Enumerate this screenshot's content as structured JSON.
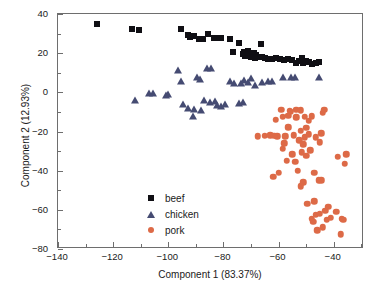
{
  "chart_data": {
    "type": "scatter",
    "title": "",
    "xlabel": "Component 1 (83.37%)",
    "ylabel": "Component 2 (12.93%)",
    "xlim": [
      -140,
      -29
    ],
    "ylim": [
      -80,
      40
    ],
    "xticks": [
      -140,
      -120,
      -100,
      -80,
      -60,
      -40
    ],
    "xticklabels": [
      "−140",
      "−120",
      "−100",
      "−80",
      "−60",
      "−40"
    ],
    "yticks": [
      40,
      20,
      0,
      -20,
      -40,
      -60,
      -80
    ],
    "yticklabels": [
      "40",
      "20",
      "0",
      "−20",
      "−40",
      "−60",
      "−80"
    ],
    "minor_xticks": [
      -130,
      -110,
      -90,
      -70,
      -50,
      -30
    ],
    "minor_yticks": [
      30,
      10,
      -10,
      -30,
      -50,
      -70
    ],
    "grid": false,
    "legend_position": "lower-left-inside",
    "series": [
      {
        "name": "beef",
        "marker": "square",
        "color": "#100f14",
        "points": [
          [
            -126.0,
            35.0
          ],
          [
            -113.0,
            32.3
          ],
          [
            -110.5,
            31.6
          ],
          [
            -95.5,
            32.2
          ],
          [
            -93.0,
            29.5
          ],
          [
            -92.0,
            28.5
          ],
          [
            -90.5,
            28.8
          ],
          [
            -89.0,
            27.2
          ],
          [
            -87.5,
            27.0
          ],
          [
            -85.5,
            30.0
          ],
          [
            -83.5,
            27.8
          ],
          [
            -82.5,
            27.6
          ],
          [
            -81.0,
            27.8
          ],
          [
            -77.5,
            27.3
          ],
          [
            -76.5,
            20.4
          ],
          [
            -74.5,
            25.0
          ],
          [
            -73.0,
            19.8
          ],
          [
            -72.5,
            20.5
          ],
          [
            -72.0,
            18.6
          ],
          [
            -71.0,
            21.0
          ],
          [
            -70.5,
            19.2
          ],
          [
            -70.0,
            17.8
          ],
          [
            -69.5,
            18.4
          ],
          [
            -69.0,
            20.2
          ],
          [
            -68.5,
            17.4
          ],
          [
            -68.0,
            19.0
          ],
          [
            -67.5,
            17.9
          ],
          [
            -66.5,
            24.7
          ],
          [
            -66.0,
            18.0
          ],
          [
            -65.0,
            17.5
          ],
          [
            -64.0,
            17.2
          ],
          [
            -62.5,
            17.1
          ],
          [
            -61.0,
            17.6
          ],
          [
            -59.5,
            16.9
          ],
          [
            -58.0,
            16.6
          ],
          [
            -56.5,
            16.8
          ],
          [
            -55.0,
            16.5
          ],
          [
            -53.5,
            15.2
          ],
          [
            -52.5,
            16.2
          ],
          [
            -51.5,
            17.4
          ],
          [
            -51.0,
            15.0
          ],
          [
            -50.0,
            16.0
          ],
          [
            -49.0,
            15.6
          ],
          [
            -48.0,
            14.6
          ],
          [
            -46.5,
            15.0
          ],
          [
            -45.5,
            15.4
          ]
        ]
      },
      {
        "name": "chicken",
        "marker": "triangle",
        "color": "#454b72",
        "points": [
          [
            -112.0,
            -3.8
          ],
          [
            -107.0,
            -0.2
          ],
          [
            -105.5,
            -0.4
          ],
          [
            -101.0,
            -1.2
          ],
          [
            -100.0,
            -1.0
          ],
          [
            -96.5,
            11.5
          ],
          [
            -95.5,
            5.8
          ],
          [
            -94.5,
            -6.0
          ],
          [
            -93.0,
            -8.0
          ],
          [
            -91.0,
            -12.0
          ],
          [
            -90.5,
            -8.5
          ],
          [
            -89.5,
            7.8
          ],
          [
            -88.5,
            7.0
          ],
          [
            -88.0,
            -9.0
          ],
          [
            -87.0,
            -4.0
          ],
          [
            -86.0,
            12.6
          ],
          [
            -85.0,
            -5.0
          ],
          [
            -84.5,
            12.4
          ],
          [
            -83.0,
            -4.5
          ],
          [
            -82.5,
            -6.6
          ],
          [
            -81.0,
            -7.0
          ],
          [
            -79.5,
            -6.2
          ],
          [
            -77.5,
            5.8
          ],
          [
            -76.0,
            4.6
          ],
          [
            -74.5,
            -5.2
          ],
          [
            -73.5,
            4.8
          ],
          [
            -73.0,
            -4.8
          ],
          [
            -72.5,
            6.2
          ],
          [
            -71.0,
            5.4
          ],
          [
            -70.0,
            7.3
          ],
          [
            -68.5,
            3.8
          ],
          [
            -66.0,
            5.4
          ],
          [
            -64.0,
            6.0
          ],
          [
            -62.5,
            5.6
          ],
          [
            -58.5,
            7.6
          ],
          [
            -55.5,
            8.0
          ],
          [
            -54.0,
            7.8
          ],
          [
            -45.5,
            7.7
          ]
        ]
      },
      {
        "name": "pork",
        "marker": "circle",
        "color": "#dd6a47",
        "points": [
          [
            -67.5,
            -22.3
          ],
          [
            -65.0,
            -22.2
          ],
          [
            -63.0,
            -22.0
          ],
          [
            -61.0,
            -14.0
          ],
          [
            -60.5,
            -22.4
          ],
          [
            -60.0,
            -41.0
          ],
          [
            -59.0,
            -8.8
          ],
          [
            -58.5,
            -28.8
          ],
          [
            -57.5,
            -22.5
          ],
          [
            -56.5,
            -17.8
          ],
          [
            -56.0,
            -9.5
          ],
          [
            -55.5,
            -10.0
          ],
          [
            -55.0,
            -31.5
          ],
          [
            -54.5,
            -22.0
          ],
          [
            -54.0,
            -35.5
          ],
          [
            -53.5,
            -9.0
          ],
          [
            -53.0,
            -40.0
          ],
          [
            -52.5,
            -24.5
          ],
          [
            -52.0,
            -19.5
          ],
          [
            -52.0,
            -9.2
          ],
          [
            -51.5,
            -30.5
          ],
          [
            -51.0,
            -45.8
          ],
          [
            -50.5,
            -23.0
          ],
          [
            -50.5,
            -12.5
          ],
          [
            -50.0,
            -32.5
          ],
          [
            -49.5,
            -57.0
          ],
          [
            -49.0,
            -21.5
          ],
          [
            -48.5,
            -29.5
          ],
          [
            -48.0,
            -64.5
          ],
          [
            -47.5,
            -66.0
          ],
          [
            -47.0,
            -55.5
          ],
          [
            -47.0,
            -41.0
          ],
          [
            -46.5,
            -23.0
          ],
          [
            -46.5,
            -62.5
          ],
          [
            -46.0,
            -70.5
          ],
          [
            -45.5,
            -44.8
          ],
          [
            -45.0,
            -25.5
          ],
          [
            -45.0,
            -62.0
          ],
          [
            -44.5,
            -21.0
          ],
          [
            -44.5,
            -45.0
          ],
          [
            -44.0,
            -10.5
          ],
          [
            -44.0,
            -69.0
          ],
          [
            -43.5,
            -9.0
          ],
          [
            -43.0,
            -60.5
          ],
          [
            -42.5,
            -65.0
          ],
          [
            -42.0,
            -58.5
          ],
          [
            -41.0,
            -64.0
          ],
          [
            -39.0,
            -61.0
          ],
          [
            -38.5,
            -33.0
          ],
          [
            -37.5,
            -72.5
          ],
          [
            -37.0,
            -64.5
          ],
          [
            -36.5,
            -65.0
          ],
          [
            -36.0,
            -36.5
          ],
          [
            -35.5,
            -31.5
          ],
          [
            -56.5,
            -12.0
          ],
          [
            -53.5,
            -12.8
          ],
          [
            -62.0,
            -43.0
          ],
          [
            -58.0,
            -26.0
          ],
          [
            -51.0,
            -26.5
          ],
          [
            -50.0,
            -18.0
          ],
          [
            -49.0,
            -14.5
          ],
          [
            -48.0,
            -12.2
          ],
          [
            -58.5,
            -12.5
          ],
          [
            -61.5,
            -22.2
          ],
          [
            -57.0,
            -35.0
          ],
          [
            -52.0,
            -48.0
          ]
        ]
      }
    ]
  },
  "legend": {
    "entries": [
      {
        "label": "beef",
        "marker": "square",
        "color": "#100f14"
      },
      {
        "label": "chicken",
        "marker": "triangle",
        "color": "#454b72"
      },
      {
        "label": "pork",
        "marker": "circle",
        "color": "#dd6a47"
      }
    ]
  }
}
